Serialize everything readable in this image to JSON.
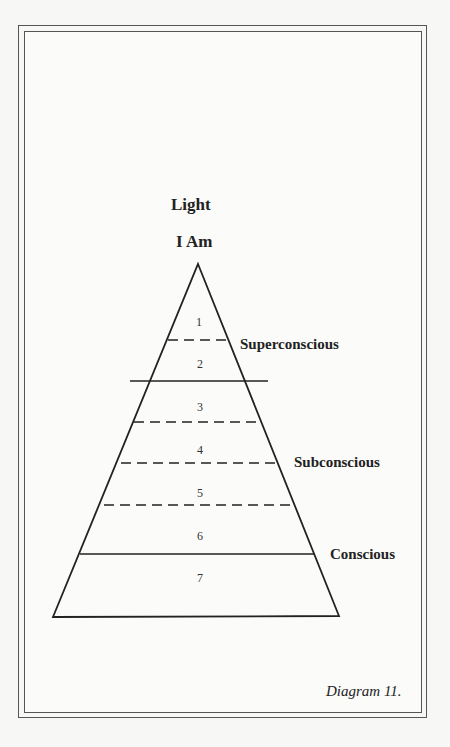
{
  "diagram": {
    "top_labels": [
      "Light",
      "I Am"
    ],
    "levels": [
      {
        "number": "1"
      },
      {
        "number": "2"
      },
      {
        "number": "3"
      },
      {
        "number": "4"
      },
      {
        "number": "5"
      },
      {
        "number": "6"
      },
      {
        "number": "7"
      }
    ],
    "zones": [
      {
        "label": "Superconscious"
      },
      {
        "label": "Subconscious"
      },
      {
        "label": "Conscious"
      }
    ],
    "caption": "Diagram 11."
  }
}
